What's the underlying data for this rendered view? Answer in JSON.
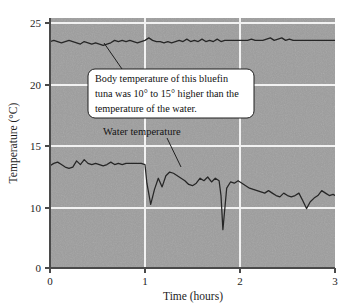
{
  "chart_data": {
    "type": "line",
    "title": "",
    "xlabel": "Time (hours)",
    "ylabel": "Temperature (°C)",
    "xlim": [
      0,
      3
    ],
    "ylim": [
      0,
      25
    ],
    "xticks": [
      "0",
      "1",
      "2",
      "3"
    ],
    "xtick_values": [
      0,
      1,
      2,
      3
    ],
    "yticks": [
      "0",
      "10",
      "15",
      "20",
      "25"
    ],
    "ytick_values": [
      0,
      10,
      15,
      20,
      25
    ],
    "grid": "white horizontal gridlines at 10, 15, 20, 25 and vertical gridlines at 1 and 2",
    "legend_position": "inline annotations",
    "axis_note": "y-axis is broken/compressed between 0 and 10",
    "plot_background": "#9e9e9e",
    "gridline_color": "#f0f0f0",
    "line_color": "#262626",
    "series": [
      {
        "name": "Body temperature",
        "label_text": "",
        "x": [
          0.0,
          0.04,
          0.08,
          0.12,
          0.16,
          0.2,
          0.24,
          0.28,
          0.32,
          0.36,
          0.4,
          0.44,
          0.48,
          0.52,
          0.56,
          0.6,
          0.64,
          0.68,
          0.72,
          0.76,
          0.8,
          0.84,
          0.88,
          0.92,
          0.96,
          1.0,
          1.04,
          1.08,
          1.12,
          1.16,
          1.2,
          1.24,
          1.28,
          1.32,
          1.36,
          1.4,
          1.44,
          1.48,
          1.52,
          1.56,
          1.6,
          1.64,
          1.68,
          1.72,
          1.76,
          1.8,
          1.84,
          1.88,
          1.92,
          1.96,
          2.0,
          2.04,
          2.08,
          2.12,
          2.16,
          2.2,
          2.24,
          2.28,
          2.32,
          2.36,
          2.4,
          2.44,
          2.48,
          2.52,
          2.56,
          2.6,
          2.64,
          2.68,
          2.72,
          2.76,
          2.8,
          2.84,
          2.88,
          2.92,
          2.96,
          3.0
        ],
        "values": [
          23.5,
          23.6,
          23.5,
          23.4,
          23.5,
          23.6,
          23.5,
          23.4,
          23.3,
          23.5,
          23.4,
          23.3,
          23.4,
          23.3,
          23.2,
          23.3,
          23.4,
          23.6,
          23.5,
          23.6,
          23.5,
          23.6,
          23.5,
          23.4,
          23.5,
          23.6,
          23.8,
          23.6,
          23.5,
          23.5,
          23.4,
          23.5,
          23.4,
          23.5,
          23.6,
          23.5,
          23.7,
          23.5,
          23.6,
          23.5,
          23.7,
          23.5,
          23.6,
          23.5,
          23.7,
          23.5,
          23.6,
          23.6,
          23.6,
          23.6,
          23.6,
          23.6,
          23.6,
          23.7,
          23.6,
          23.6,
          23.6,
          23.7,
          23.8,
          23.6,
          23.7,
          23.8,
          23.6,
          23.7,
          23.6,
          23.6,
          23.6,
          23.6,
          23.6,
          23.6,
          23.6,
          23.6,
          23.6,
          23.6,
          23.6,
          23.6
        ]
      },
      {
        "name": "Water temperature",
        "label_text": "Water temperature",
        "x": [
          0.0,
          0.04,
          0.08,
          0.12,
          0.16,
          0.2,
          0.24,
          0.28,
          0.32,
          0.36,
          0.4,
          0.44,
          0.48,
          0.52,
          0.56,
          0.6,
          0.64,
          0.68,
          0.72,
          0.76,
          0.8,
          0.84,
          0.88,
          0.92,
          0.96,
          1.0,
          1.02,
          1.06,
          1.1,
          1.14,
          1.18,
          1.22,
          1.26,
          1.3,
          1.34,
          1.38,
          1.42,
          1.46,
          1.5,
          1.54,
          1.58,
          1.62,
          1.66,
          1.7,
          1.74,
          1.78,
          1.8,
          1.82,
          1.86,
          1.9,
          1.94,
          1.98,
          2.02,
          2.06,
          2.1,
          2.14,
          2.18,
          2.22,
          2.26,
          2.3,
          2.34,
          2.38,
          2.42,
          2.46,
          2.5,
          2.54,
          2.58,
          2.62,
          2.66,
          2.7,
          2.74,
          2.78,
          2.82,
          2.86,
          2.9,
          2.94,
          2.98,
          3.0
        ],
        "values": [
          13.4,
          13.6,
          13.7,
          13.5,
          13.3,
          13.2,
          13.3,
          13.8,
          13.5,
          13.9,
          13.6,
          13.5,
          13.6,
          13.5,
          13.4,
          13.5,
          13.7,
          13.5,
          13.6,
          13.5,
          13.6,
          13.6,
          13.6,
          13.6,
          13.6,
          13.5,
          12.0,
          10.3,
          11.5,
          12.4,
          11.7,
          12.6,
          12.9,
          12.8,
          12.6,
          12.4,
          12.2,
          11.9,
          11.8,
          12.0,
          12.4,
          12.2,
          12.5,
          12.1,
          12.4,
          12.2,
          11.0,
          6.4,
          11.6,
          12.1,
          12.0,
          12.2,
          12.0,
          11.8,
          11.6,
          11.5,
          11.4,
          11.3,
          11.2,
          11.4,
          11.2,
          11.0,
          10.9,
          11.2,
          11.0,
          10.9,
          11.0,
          11.2,
          10.6,
          9.9,
          10.5,
          10.8,
          11.0,
          11.4,
          11.2,
          11.0,
          11.1,
          11.0
        ]
      }
    ],
    "annotations": [
      {
        "id": "body-temp-callout",
        "lines": [
          "Body temperature of this bluefin",
          "tuna was 10° to 15° higher than the",
          "temperature of the water."
        ],
        "full_text": "Body temperature of this bluefin tuna was 10° to 15° higher than the temperature of the water.",
        "style": "white rounded box with thin dark border and leader line to upper curve"
      },
      {
        "id": "water-temp-label",
        "text": "Water temperature",
        "style": "plain text with leader line to lower curve"
      }
    ]
  }
}
